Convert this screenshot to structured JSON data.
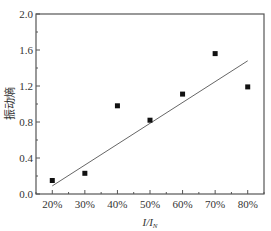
{
  "chart_data": {
    "type": "scatter",
    "title": "",
    "xlabel": "I/I_N",
    "xlabel_main": "I/I",
    "xlabel_sub": "N",
    "ylabel": "振动熵",
    "categories": [
      "20%",
      "30%",
      "40%",
      "50%",
      "60%",
      "70%",
      "80%"
    ],
    "x": [
      20,
      30,
      40,
      50,
      60,
      70,
      80
    ],
    "series": [
      {
        "name": "measured",
        "marker": "square",
        "values": [
          0.15,
          0.23,
          0.98,
          0.82,
          1.11,
          1.56,
          1.19
        ]
      },
      {
        "name": "linear fit",
        "type": "line",
        "x": [
          20,
          80
        ],
        "values": [
          0.09,
          1.48
        ]
      }
    ],
    "xlim": [
      15,
      85
    ],
    "ylim": [
      0.0,
      2.0
    ],
    "yticks": [
      "0.0",
      "0.4",
      "0.8",
      "1.2",
      "1.6",
      "2.0"
    ],
    "yticks_values": [
      0.0,
      0.4,
      0.8,
      1.2,
      1.6,
      2.0
    ],
    "grid": false,
    "legend": null,
    "colors": {
      "axis": "#555555",
      "marker": "#111111",
      "fit_line": "#666666",
      "text": "#333333"
    }
  }
}
